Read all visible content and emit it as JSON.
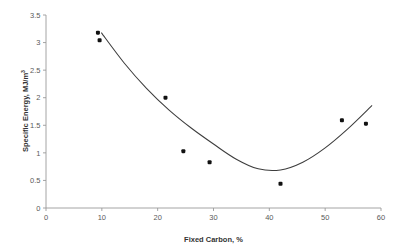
{
  "chart_data": {
    "type": "scatter",
    "title": "",
    "xlabel": "Fixed Carbon, %",
    "ylabel": "Specific Energy, MJ/m",
    "ylabel_superscript": "3",
    "ylabel_full": "Specific Energy, MJ/m3",
    "xlim": [
      0,
      60
    ],
    "ylim": [
      0,
      3.5
    ],
    "xticks": [
      0,
      10,
      20,
      30,
      40,
      50,
      60
    ],
    "xtick_labels": [
      "0",
      "10",
      "20",
      "30",
      "40",
      "50",
      "60"
    ],
    "yticks": [
      0,
      0.5,
      1,
      1.5,
      2,
      2.5,
      3,
      3.5
    ],
    "ytick_labels": [
      "0",
      "0.5",
      "1",
      "1.5",
      "2",
      "2.5",
      "3",
      "3.5"
    ],
    "grid": false,
    "legend": false,
    "legend_position": "none",
    "marker_color": "#111111",
    "curve_color": "#3d3d3d",
    "axis_color": "#9a9a9a",
    "background_color": "#ffffff",
    "series": [
      {
        "name": "Specific Energy measurements",
        "marker": "filled-square",
        "x": [
          9.3,
          9.6,
          21.4,
          24.6,
          29.3,
          42.0,
          53.0,
          57.3
        ],
        "y": [
          3.18,
          3.04,
          2.0,
          1.03,
          0.83,
          0.44,
          1.59,
          1.53
        ]
      },
      {
        "name": "Quadratic fit",
        "type": "line",
        "x": [
          9.9,
          14.0,
          18.0,
          22.0,
          26.0,
          30.0,
          34.0,
          38.0,
          42.0,
          46.0,
          50.0,
          54.0,
          58.4
        ],
        "y": [
          3.18,
          2.63,
          2.17,
          1.78,
          1.45,
          1.16,
          0.89,
          0.71,
          0.69,
          0.83,
          1.09,
          1.43,
          1.86
        ],
        "vertex": [
          38.0,
          0.66
        ]
      }
    ]
  },
  "axes": {
    "x_title": "Fixed Carbon, %",
    "y_title_main": "Specific Energy, MJ/m",
    "y_title_sup": "3"
  }
}
